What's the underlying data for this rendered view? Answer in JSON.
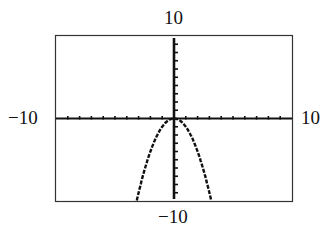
{
  "labels": {
    "ymax": "10",
    "ymin": "−10",
    "xmin": "−10",
    "xmax": "10"
  },
  "chart_data": {
    "type": "line",
    "title": "",
    "xlabel": "",
    "ylabel": "",
    "xlim": [
      -10,
      10
    ],
    "ylim": [
      -10,
      10
    ],
    "xscale": 1,
    "yscale": 1,
    "grid": false,
    "function": "y = -x^2",
    "series": [
      {
        "name": "y = -x^2",
        "x": [
          -3.2,
          -3,
          -2.5,
          -2,
          -1.5,
          -1,
          -0.5,
          0,
          0.5,
          1,
          1.5,
          2,
          2.5,
          3,
          3.2
        ],
        "y": [
          -10.24,
          -9,
          -6.25,
          -4,
          -2.25,
          -1,
          -0.25,
          0,
          -0.25,
          -1,
          -2.25,
          -4,
          -6.25,
          -9,
          -10.24
        ]
      }
    ],
    "tick_labels": {
      "top": "10",
      "bottom": "−10",
      "left": "−10",
      "right": "10"
    },
    "colors": {
      "axis": "#111111",
      "curve": "#111111",
      "frame": "#333333"
    }
  }
}
